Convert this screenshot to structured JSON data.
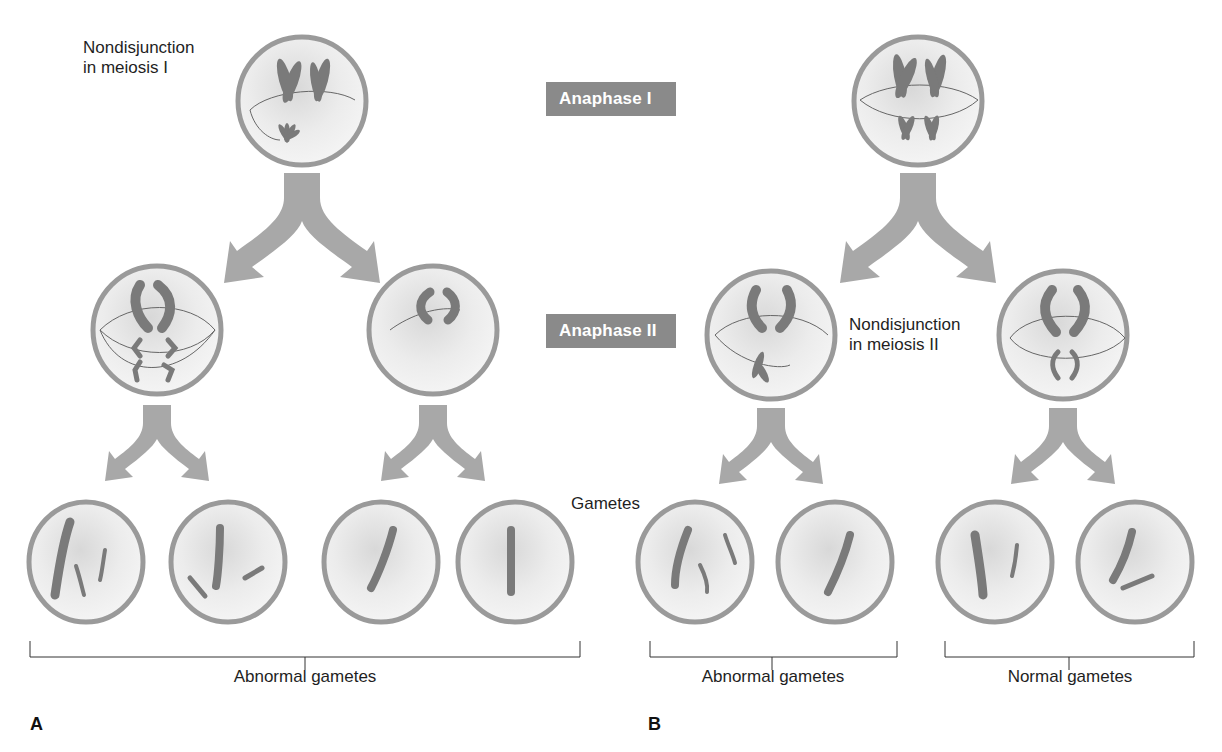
{
  "stages": {
    "anaphase1": "Anaphase I",
    "anaphase2": "Anaphase II"
  },
  "panelA": {
    "letter": "A",
    "annotation_line1": "Nondisjunction",
    "annotation_line2": "in meiosis I",
    "group_label": "Abnormal gametes"
  },
  "panelB": {
    "letter": "B",
    "annotation_line1": "Nondisjunction",
    "annotation_line2": "in meiosis II",
    "group_label_abnormal": "Abnormal gametes",
    "group_label_normal": "Normal gametes"
  },
  "gametes_label": "Gametes",
  "colors": {
    "cell_border": "#9a9a9a",
    "cell_fill": "#eeeeee",
    "chromosome": "#7a7a7a",
    "arrow": "#a8a8a8",
    "stage_box": "#8a8a8a"
  }
}
